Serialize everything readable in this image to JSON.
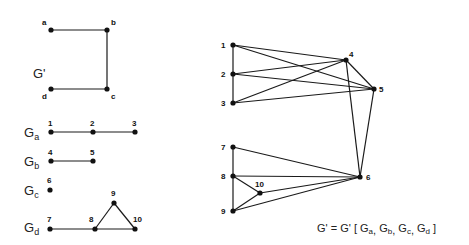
{
  "left_panel": {
    "g_prime": {
      "label": "G'",
      "label_pos": [
        33,
        78
      ],
      "nodes": [
        {
          "id": "a",
          "x": 51,
          "y": 30,
          "lx": 42,
          "ly": 25
        },
        {
          "id": "b",
          "x": 107,
          "y": 30,
          "lx": 111,
          "ly": 25
        },
        {
          "id": "c",
          "x": 107,
          "y": 89,
          "lx": 111,
          "ly": 99
        },
        {
          "id": "d",
          "x": 51,
          "y": 89,
          "lx": 42,
          "ly": 99
        }
      ],
      "edges": [
        [
          "a",
          "b"
        ],
        [
          "b",
          "c"
        ],
        [
          "d",
          "c"
        ]
      ]
    },
    "subgraphs": [
      {
        "name": "G",
        "sub": "a",
        "label_pos": [
          24,
          137
        ],
        "nodes": [
          {
            "id": "1",
            "x": 51,
            "y": 132,
            "lx": 48,
            "ly": 126
          },
          {
            "id": "2",
            "x": 93,
            "y": 132,
            "lx": 90,
            "ly": 126
          },
          {
            "id": "3",
            "x": 135,
            "y": 132,
            "lx": 132,
            "ly": 126
          }
        ],
        "edges": [
          [
            "1",
            "2"
          ],
          [
            "2",
            "3"
          ]
        ]
      },
      {
        "name": "G",
        "sub": "b",
        "label_pos": [
          24,
          166
        ],
        "nodes": [
          {
            "id": "4",
            "x": 51,
            "y": 161,
            "lx": 48,
            "ly": 155
          },
          {
            "id": "5",
            "x": 93,
            "y": 161,
            "lx": 90,
            "ly": 155
          }
        ],
        "edges": [
          [
            "4",
            "5"
          ]
        ]
      },
      {
        "name": "G",
        "sub": "c",
        "label_pos": [
          24,
          195
        ],
        "nodes": [
          {
            "id": "6",
            "x": 50,
            "y": 190,
            "lx": 47,
            "ly": 183
          }
        ],
        "edges": []
      },
      {
        "name": "G",
        "sub": "d",
        "label_pos": [
          24,
          232
        ],
        "nodes": [
          {
            "id": "7",
            "x": 50,
            "y": 229,
            "lx": 47,
            "ly": 222
          },
          {
            "id": "8",
            "x": 95,
            "y": 229,
            "lx": 89,
            "ly": 222
          },
          {
            "id": "9",
            "x": 114,
            "y": 203,
            "lx": 111,
            "ly": 196
          },
          {
            "id": "10",
            "x": 135,
            "y": 229,
            "lx": 133,
            "ly": 222
          }
        ],
        "edges": [
          [
            "7",
            "8"
          ],
          [
            "8",
            "10"
          ],
          [
            "8",
            "9"
          ],
          [
            "9",
            "10"
          ]
        ]
      }
    ]
  },
  "right_panel": {
    "nodes": [
      {
        "id": "1",
        "x": 233,
        "y": 45,
        "lx": 221,
        "ly": 48
      },
      {
        "id": "2",
        "x": 233,
        "y": 74,
        "lx": 221,
        "ly": 77
      },
      {
        "id": "3",
        "x": 233,
        "y": 103,
        "lx": 221,
        "ly": 106
      },
      {
        "id": "4",
        "x": 346,
        "y": 60,
        "lx": 349,
        "ly": 57
      },
      {
        "id": "5",
        "x": 374,
        "y": 89,
        "lx": 379,
        "ly": 92
      },
      {
        "id": "6",
        "x": 360,
        "y": 177,
        "lx": 366,
        "ly": 180
      },
      {
        "id": "7",
        "x": 233,
        "y": 147,
        "lx": 221,
        "ly": 150
      },
      {
        "id": "8",
        "x": 233,
        "y": 176,
        "lx": 221,
        "ly": 179
      },
      {
        "id": "9",
        "x": 233,
        "y": 211,
        "lx": 221,
        "ly": 214
      },
      {
        "id": "10",
        "x": 260,
        "y": 193,
        "lx": 255,
        "ly": 187
      }
    ],
    "edges": [
      [
        "1",
        "2"
      ],
      [
        "2",
        "3"
      ],
      [
        "1",
        "4"
      ],
      [
        "1",
        "5"
      ],
      [
        "2",
        "4"
      ],
      [
        "2",
        "5"
      ],
      [
        "3",
        "4"
      ],
      [
        "3",
        "5"
      ],
      [
        "4",
        "5"
      ],
      [
        "4",
        "6"
      ],
      [
        "5",
        "6"
      ],
      [
        "7",
        "8"
      ],
      [
        "8",
        "9"
      ],
      [
        "8",
        "10"
      ],
      [
        "9",
        "10"
      ],
      [
        "7",
        "6"
      ],
      [
        "8",
        "6"
      ],
      [
        "9",
        "6"
      ],
      [
        "10",
        "6"
      ]
    ]
  },
  "formula": {
    "prefix": "G' = G' [ ",
    "terms": [
      {
        "name": "G",
        "sub": "a"
      },
      {
        "name": "G",
        "sub": "b"
      },
      {
        "name": "G",
        "sub": "c"
      },
      {
        "name": "G",
        "sub": "d"
      }
    ],
    "separator": ", ",
    "suffix": " ]",
    "pos": [
      317,
      232
    ]
  }
}
